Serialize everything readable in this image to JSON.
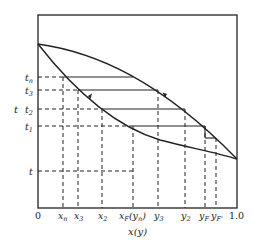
{
  "figure": {
    "type": "t-x-y phase diagram with stepwise equilibrium construction",
    "y_axis_label": "t",
    "x_axis_label": "x(y)",
    "x_ticks": [
      {
        "label": "0",
        "x": 38,
        "italic": false
      },
      {
        "label": "xn",
        "x": 63,
        "italic": true
      },
      {
        "label": "x3",
        "x": 78,
        "italic": true
      },
      {
        "label": "x2",
        "x": 102,
        "italic": true
      },
      {
        "label": "xF(yn)",
        "x": 133,
        "italic": true
      },
      {
        "label": "y3",
        "x": 158,
        "italic": true
      },
      {
        "label": "y2",
        "x": 185,
        "italic": true
      },
      {
        "label": "yF",
        "x": 205,
        "italic": true
      },
      {
        "label": "yF'",
        "x": 216,
        "italic": true
      },
      {
        "label": "1.0",
        "x": 237,
        "italic": false
      }
    ],
    "y_ticks": [
      {
        "label": "tn",
        "y": 77
      },
      {
        "label": "t3",
        "y": 90
      },
      {
        "label": "t2",
        "y": 109
      },
      {
        "label": "t1",
        "y": 126
      },
      {
        "label": "t",
        "y": 171
      }
    ],
    "curves": [
      {
        "name": "dew-point-curve",
        "description": "upper curve (vapor line)"
      },
      {
        "name": "bubble-point-curve",
        "description": "lower curve (liquid line)"
      }
    ],
    "colors": {
      "line": "#222222",
      "background": "#ffffff"
    }
  },
  "labels": {
    "t_axis": "t",
    "x_axis": "x(y)",
    "zero": "0",
    "one": "1.0",
    "tn_main": "t",
    "tn_sub": "n",
    "t3_main": "t",
    "t3_sub": "3",
    "t2_main": "t",
    "t2_sub": "2",
    "t1_main": "t",
    "t1_sub": "1",
    "t_plain": "t",
    "xn_main": "x",
    "xn_sub": "n",
    "x3_main": "x",
    "x3_sub": "3",
    "x2_main": "x",
    "x2_sub": "2",
    "xf_main": "x",
    "xf_sub": "F",
    "xf_paren": "(y",
    "xf_paren_sub": "n",
    "xf_close": ")",
    "y3_main": "y",
    "y3_sub": "3",
    "y2_main": "y",
    "y2_sub": "2",
    "yf_main": "y",
    "yf_sub": "F",
    "yfp_main": "y",
    "yfp_sub": "F'"
  }
}
